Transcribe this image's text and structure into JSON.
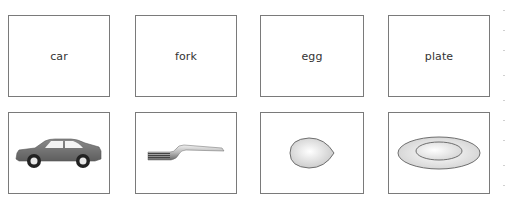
{
  "word_cards": [
    {
      "label": "car"
    },
    {
      "label": "fork"
    },
    {
      "label": "egg"
    },
    {
      "label": "plate"
    }
  ],
  "picture_cards": [
    {
      "icon": "car-icon",
      "depicts": "car"
    },
    {
      "icon": "fork-icon",
      "depicts": "fork"
    },
    {
      "icon": "egg-icon",
      "depicts": "egg"
    },
    {
      "icon": "plate-icon",
      "depicts": "plate"
    }
  ],
  "colors": {
    "border": "#7a7a7a",
    "car_body": "#707070",
    "text": "#333333"
  }
}
